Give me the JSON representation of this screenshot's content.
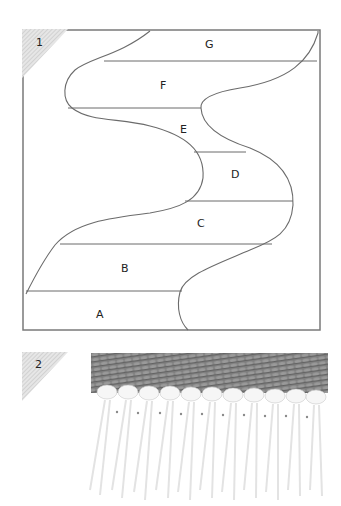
{
  "figure1": {
    "number": "1",
    "sections": [
      {
        "label": "G",
        "x": 210,
        "y": 47
      },
      {
        "label": "F",
        "x": 163,
        "y": 88
      },
      {
        "label": "E",
        "x": 183,
        "y": 131
      },
      {
        "label": "D",
        "x": 235,
        "y": 177
      },
      {
        "label": "C",
        "x": 200,
        "y": 226
      },
      {
        "label": "B",
        "x": 125,
        "y": 271
      },
      {
        "label": "A",
        "x": 100,
        "y": 317
      }
    ],
    "colors": {
      "line": "#6b6b6b",
      "frame": "#777777",
      "corner": "#c8c8c8"
    }
  },
  "figure2": {
    "number": "2",
    "description": "Close-up photo of woven fabric edge with white fringe tassels",
    "colors": {
      "weave": "#7a7a7a",
      "weave_dark": "#555555",
      "fringe": "#f4f4f4"
    }
  }
}
